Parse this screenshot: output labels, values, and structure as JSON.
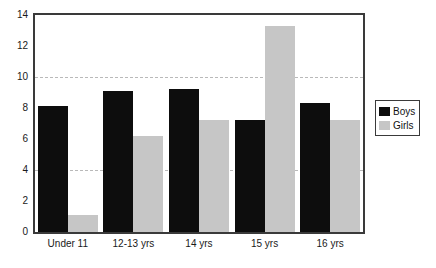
{
  "chart_data": {
    "type": "bar",
    "title": "",
    "xlabel": "",
    "ylabel": "",
    "categories": [
      "Under 11",
      "12-13 yrs",
      "14 yrs",
      "15 yrs",
      "16 yrs"
    ],
    "series": [
      {
        "name": "Boys",
        "color": "#0d0d0d",
        "values": [
          8.1,
          9.1,
          9.2,
          7.2,
          8.3
        ]
      },
      {
        "name": "Girls",
        "color": "#c6c6c6",
        "values": [
          1.1,
          6.2,
          7.2,
          13.3,
          7.2
        ]
      }
    ],
    "ylim": [
      0,
      14
    ],
    "yticks": [
      0,
      2,
      4,
      6,
      8,
      10,
      12,
      14
    ],
    "ytick_labels": [
      "0",
      "2",
      "4",
      "6",
      "8",
      "10",
      "12",
      "14"
    ],
    "gridlines": [
      4,
      10
    ],
    "grid": true,
    "grid_style": "dashed",
    "legend": {
      "position": "right",
      "entries": [
        {
          "label": "Boys",
          "color": "#0d0d0d"
        },
        {
          "label": "Girls",
          "color": "#c6c6c6"
        }
      ]
    },
    "frame_color": "#3a3a3a",
    "background": "#ffffff"
  }
}
